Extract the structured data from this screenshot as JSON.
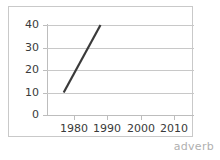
{
  "watermark": {
    "text": "adverb"
  },
  "colors": {
    "line": "#3a3a3a",
    "gridline": "#c8c8c8",
    "axis": "#bdbdbd",
    "frame": "#c9c9c9",
    "label": "#3a3a3a",
    "watermark": "#b0b0b0",
    "background": "#ffffff"
  },
  "chart_data": {
    "type": "line",
    "title": "",
    "xlabel": "",
    "ylabel": "",
    "xlim": [
      1972,
      2016
    ],
    "ylim": [
      0,
      40
    ],
    "grid": true,
    "legend": null,
    "y_ticks": [
      40,
      30,
      20,
      10,
      0
    ],
    "y_tick_labels": [
      "40",
      "30",
      "20",
      "10",
      "0"
    ],
    "x_ticks": [
      1980,
      1990,
      2000,
      2010
    ],
    "x_tick_labels": [
      "1980",
      "1990",
      "2000",
      "2010"
    ],
    "series": [
      {
        "name": "",
        "x": [
          1977,
          1988
        ],
        "values": [
          10,
          40
        ]
      }
    ]
  }
}
